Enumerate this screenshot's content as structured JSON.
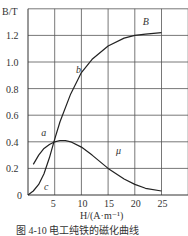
{
  "chart_data": {
    "type": "line",
    "title": "",
    "caption": "图 4-10 电工纯铁的磁化曲线",
    "xlabel": "H/(A·m⁻¹)",
    "ylabel": "B/T",
    "xlim": [
      0,
      30
    ],
    "ylim": [
      0,
      1.4
    ],
    "grid": true,
    "xticks": [
      "5",
      "10",
      "15",
      "20",
      "25"
    ],
    "yticks": [
      "0",
      "0.2",
      "0.4",
      "0.6",
      "0.8",
      "1.0",
      "1.2"
    ],
    "series": [
      {
        "name": "B",
        "x": [
          0,
          1,
          2,
          3,
          4,
          5,
          6,
          8,
          10,
          12,
          15,
          18,
          20,
          22,
          25
        ],
        "y": [
          0,
          0.03,
          0.08,
          0.16,
          0.28,
          0.42,
          0.55,
          0.76,
          0.92,
          1.02,
          1.12,
          1.18,
          1.2,
          1.21,
          1.22
        ]
      },
      {
        "name": "μ",
        "x": [
          1,
          2,
          3,
          4,
          5,
          6,
          7,
          8,
          10,
          12,
          15,
          18,
          20,
          22,
          25
        ],
        "y": [
          0.23,
          0.3,
          0.35,
          0.38,
          0.4,
          0.41,
          0.41,
          0.4,
          0.36,
          0.3,
          0.2,
          0.12,
          0.08,
          0.05,
          0.03
        ]
      }
    ],
    "annotations": [
      {
        "text": "B",
        "x": 21.5,
        "y": 1.28
      },
      {
        "text": "b",
        "x": 9,
        "y": 0.92
      },
      {
        "text": "a",
        "x": 2.5,
        "y": 0.44
      },
      {
        "text": "c",
        "x": 3,
        "y": 0.04
      },
      {
        "text": "μ",
        "x": 16.5,
        "y": 0.31
      }
    ]
  }
}
